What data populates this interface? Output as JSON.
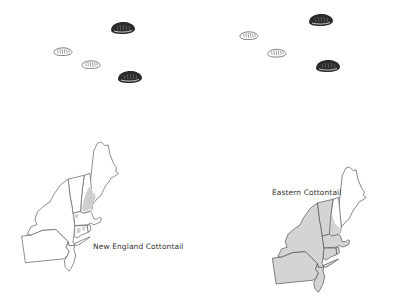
{
  "figure": {
    "panels": [
      {
        "id": "new-england-cottontail",
        "label": "New England Cottontail",
        "colors": {
          "state_outline": "#6a6a6a",
          "range_fill": "#cfcfcf",
          "land_fill": "#ffffff"
        },
        "range_description": "Small patchy range in southern New Hampshire / southern Maine and small areas in Massachusetts, Connecticut, Rhode Island and eastern New York",
        "seeds": [
          {
            "tone": "dark",
            "x": 123,
            "y": 28
          },
          {
            "tone": "light",
            "x": 63,
            "y": 52
          },
          {
            "tone": "light",
            "x": 91,
            "y": 65
          },
          {
            "tone": "dark",
            "x": 130,
            "y": 77
          }
        ]
      },
      {
        "id": "eastern-cottontail",
        "label": "Eastern Cottontail",
        "colors": {
          "state_outline": "#5a5a5a",
          "range_fill": "#d4d4d4",
          "land_fill": "#ffffff"
        },
        "range_description": "Widespread across New York, Pennsylvania, New Jersey, Connecticut, Rhode Island, Massachusetts, Vermont and southern New Hampshire",
        "seeds": [
          {
            "tone": "dark",
            "x": 117,
            "y": 20
          },
          {
            "tone": "light",
            "x": 45,
            "y": 36
          },
          {
            "tone": "light",
            "x": 73,
            "y": 53
          },
          {
            "tone": "dark",
            "x": 124,
            "y": 66
          }
        ]
      }
    ]
  }
}
